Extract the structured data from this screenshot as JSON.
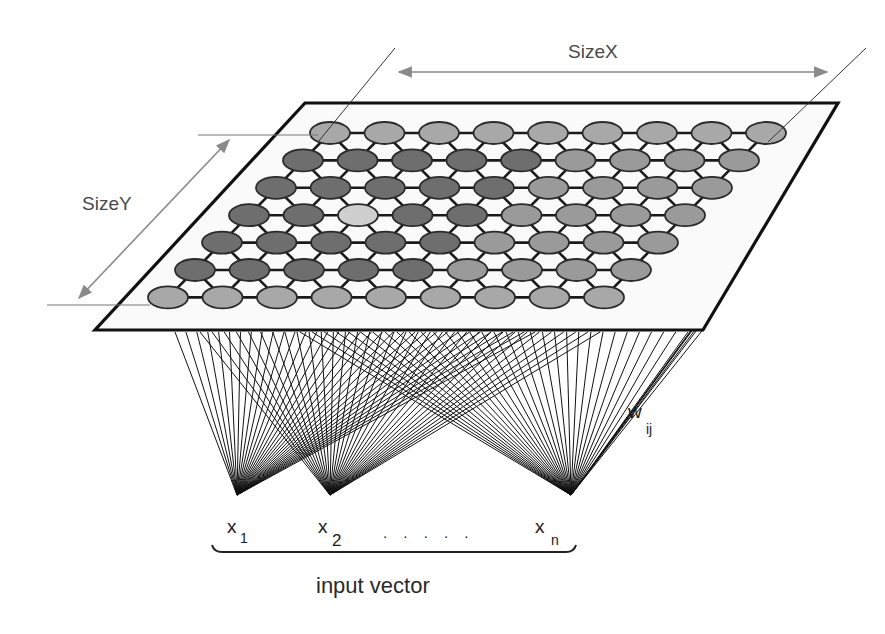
{
  "diagram": {
    "labels": {
      "size_x": "SizeX",
      "size_y": "SizeY",
      "weights_main": "w",
      "weights_sub": "ij",
      "input_caption": "input vector",
      "dots": ". . . . ."
    },
    "inputs": [
      {
        "main": "x",
        "sub": "1",
        "px": 237,
        "py": 495
      },
      {
        "main": "x",
        "sub": "2",
        "px": 330,
        "py": 495
      },
      {
        "main": "x",
        "sub": "n",
        "px": 571,
        "py": 495
      }
    ],
    "lattice": {
      "rows": 7,
      "cols": 9,
      "origin_x": 330,
      "origin_y": 133,
      "dx": 54.5,
      "row_shift_x": -27,
      "row_shift_y": 27.4,
      "node_rx": 20,
      "node_ry": 11,
      "shades": [
        [
          "L",
          "L",
          "L",
          "L",
          "L",
          "L",
          "L",
          "L",
          "L"
        ],
        [
          "D",
          "D",
          "D",
          "D",
          "D",
          "M",
          "M",
          "M",
          "M"
        ],
        [
          "D",
          "D",
          "D",
          "D",
          "D",
          "M",
          "M",
          "M",
          "M"
        ],
        [
          "D",
          "D",
          "W",
          "D",
          "D",
          "M",
          "M",
          "M",
          "M"
        ],
        [
          "D",
          "D",
          "D",
          "D",
          "D",
          "M",
          "M",
          "M",
          "M"
        ],
        [
          "D",
          "D",
          "D",
          "D",
          "D",
          "M",
          "M",
          "M",
          "M"
        ],
        [
          "L",
          "L",
          "L",
          "L",
          "L",
          "L",
          "L",
          "L",
          "L"
        ]
      ]
    },
    "plane": {
      "top_left": [
        305,
        103
      ],
      "top_right": [
        838,
        103
      ],
      "bottom_right": [
        703,
        330
      ],
      "bottom_left": [
        95,
        330
      ]
    },
    "colors": {
      "node_dark": "#6e6e6e",
      "node_medium": "#9a9a9a",
      "node_light": "#a8a8a8",
      "node_highlight": "#cfcfcf",
      "node_stroke": "#2b2b2b",
      "line": "#111111",
      "dimension": "#8a8a8a",
      "plane_fill": "#fafafa"
    }
  }
}
